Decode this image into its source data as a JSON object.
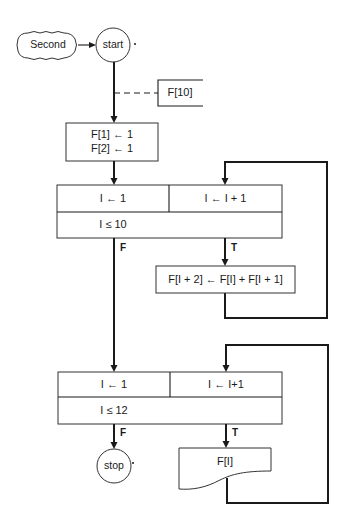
{
  "diagram": {
    "type": "flowchart",
    "connector": {
      "label": "Second"
    },
    "terminals": {
      "start": "start",
      "stop": "stop"
    },
    "annotation": {
      "label": "F[10]"
    },
    "init_block": {
      "line1": "F[1] ← 1",
      "line2": "F[2] ← 1"
    },
    "loop1": {
      "init": "I ← 1",
      "increment": "I ← I + 1",
      "condition": "I ≤ 10",
      "false_label": "F",
      "true_label": "T",
      "body": "F[I + 2] ← F[I] + F[I + 1]"
    },
    "loop2": {
      "init": "I ← 1",
      "increment": "I ← I+1",
      "condition": "I ≤ 12",
      "false_label": "F",
      "true_label": "T",
      "output": "F[I]"
    },
    "colors": {
      "line": "#1a1a1a",
      "background": "#ffffff"
    }
  }
}
